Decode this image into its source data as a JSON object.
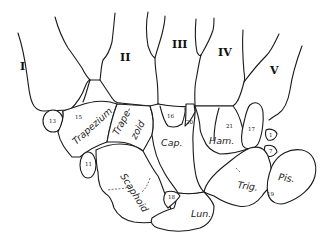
{
  "figure": {
    "type": "anatomical line drawing",
    "line_color": "#1a1a1a",
    "background": "#ffffff"
  },
  "metacarpals": [
    {
      "id": "mc1",
      "label": "I"
    },
    {
      "id": "mc2",
      "label": "II"
    },
    {
      "id": "mc3",
      "label": "III"
    },
    {
      "id": "mc4",
      "label": "IV"
    },
    {
      "id": "mc5",
      "label": "V"
    }
  ],
  "carpals": {
    "trapezium": "Trapezium",
    "trapezoid_line1": "Trape-",
    "trapezoid_line2": "zoid",
    "capitate": "Cap.",
    "hamate": "Ham.",
    "scaphoid": "Scaphoid",
    "lunate": "Lun.",
    "triquetrum": "Trig.",
    "pisiform": "Pis."
  },
  "accessory_numbers": {
    "n1": "1",
    "n7": "7",
    "n11": "11",
    "n13": "13",
    "n15": "15",
    "n16": "16",
    "n17": "17",
    "n18": "18",
    "n19": "19",
    "n20": "20",
    "n21": "21"
  }
}
